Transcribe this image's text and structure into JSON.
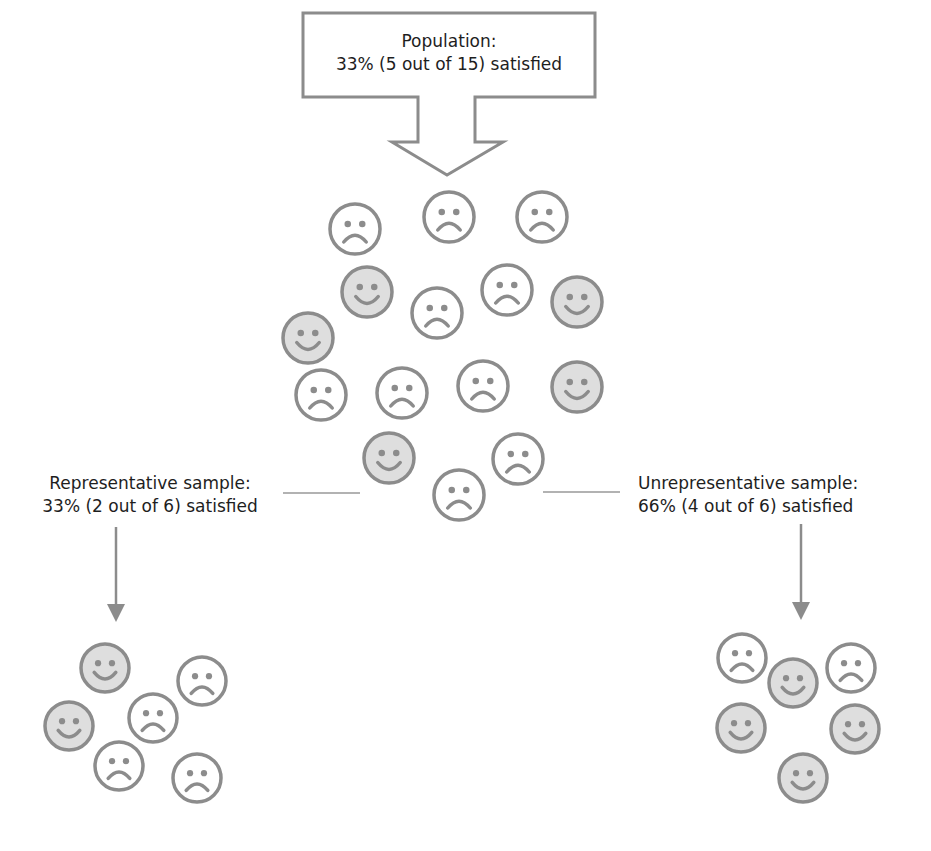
{
  "population": {
    "title": "Population:",
    "stat": "33% (5 out of 15) satisfied",
    "faces": [
      {
        "x": 355,
        "y": 229,
        "mood": "sad"
      },
      {
        "x": 449,
        "y": 217,
        "mood": "sad"
      },
      {
        "x": 542,
        "y": 217,
        "mood": "sad"
      },
      {
        "x": 367,
        "y": 292,
        "mood": "happy"
      },
      {
        "x": 437,
        "y": 313,
        "mood": "sad"
      },
      {
        "x": 507,
        "y": 290,
        "mood": "sad"
      },
      {
        "x": 577,
        "y": 302,
        "mood": "happy"
      },
      {
        "x": 308,
        "y": 338,
        "mood": "happy"
      },
      {
        "x": 321,
        "y": 395,
        "mood": "sad"
      },
      {
        "x": 402,
        "y": 393,
        "mood": "sad"
      },
      {
        "x": 483,
        "y": 386,
        "mood": "sad"
      },
      {
        "x": 577,
        "y": 387,
        "mood": "happy"
      },
      {
        "x": 389,
        "y": 458,
        "mood": "happy"
      },
      {
        "x": 518,
        "y": 459,
        "mood": "sad"
      },
      {
        "x": 459,
        "y": 495,
        "mood": "sad"
      }
    ]
  },
  "representative": {
    "title": "Representative sample:",
    "stat": "33% (2 out of 6) satisfied",
    "faces": [
      {
        "x": 105,
        "y": 668,
        "mood": "happy"
      },
      {
        "x": 202,
        "y": 681,
        "mood": "sad"
      },
      {
        "x": 69,
        "y": 726,
        "mood": "happy"
      },
      {
        "x": 153,
        "y": 718,
        "mood": "sad"
      },
      {
        "x": 119,
        "y": 766,
        "mood": "sad"
      },
      {
        "x": 197,
        "y": 778,
        "mood": "sad"
      }
    ]
  },
  "unrepresentative": {
    "title": "Unrepresentative sample:",
    "stat": "66% (4 out of 6) satisfied",
    "faces": [
      {
        "x": 742,
        "y": 658,
        "mood": "sad"
      },
      {
        "x": 793,
        "y": 683,
        "mood": "happy"
      },
      {
        "x": 851,
        "y": 668,
        "mood": "sad"
      },
      {
        "x": 741,
        "y": 728,
        "mood": "happy"
      },
      {
        "x": 855,
        "y": 729,
        "mood": "happy"
      },
      {
        "x": 803,
        "y": 778,
        "mood": "happy"
      }
    ]
  },
  "colors": {
    "stroke": "#8c8c8c",
    "happy_fill": "#dedede",
    "sad_fill": "#ffffff",
    "connector": "#999999"
  },
  "icons": {
    "happy": "smiley-face-icon",
    "sad": "frowny-face-icon",
    "arrow": "down-arrow-icon"
  }
}
